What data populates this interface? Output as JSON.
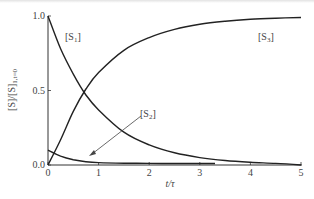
{
  "chart_data": {
    "type": "line",
    "title": "",
    "xlabel": "t/τ",
    "ylabel": "[S]/[S]1,t=0",
    "xlim": [
      0,
      5
    ],
    "ylim": [
      0,
      1.0
    ],
    "xticks": [
      "0",
      "1",
      "2",
      "3",
      "4",
      "5"
    ],
    "yticks": [
      "0.0",
      "0.5",
      "1.0"
    ],
    "grid": false,
    "legend": "inline labels",
    "series": [
      {
        "name": "[S1]",
        "x": [
          0,
          0.25,
          0.5,
          0.75,
          1,
          1.5,
          2,
          2.5,
          3,
          3.5,
          4,
          4.5,
          5
        ],
        "values": [
          1.0,
          0.78,
          0.61,
          0.47,
          0.37,
          0.22,
          0.135,
          0.082,
          0.05,
          0.03,
          0.018,
          0.011,
          0.0
        ]
      },
      {
        "name": "[S2]",
        "x": [
          0,
          0.25,
          0.5,
          0.75,
          1,
          1.5,
          2,
          2.5,
          3,
          3.3
        ],
        "values": [
          0.1,
          0.06,
          0.035,
          0.022,
          0.016,
          0.012,
          0.011,
          0.01,
          0.01,
          0.01
        ]
      },
      {
        "name": "[S3]",
        "x": [
          0,
          0.25,
          0.5,
          0.75,
          1,
          1.5,
          2,
          2.5,
          3,
          3.5,
          4,
          4.5,
          5
        ],
        "values": [
          0.0,
          0.17,
          0.36,
          0.51,
          0.62,
          0.77,
          0.855,
          0.91,
          0.945,
          0.965,
          0.978,
          0.985,
          0.99
        ]
      }
    ],
    "annotations": [
      {
        "text": "[S1]",
        "near": "top-left decaying curve"
      },
      {
        "text": "[S3]",
        "near": "upper-right rising curve"
      },
      {
        "text": "[S2]",
        "near": "arrow pointing to small curve near bottom"
      }
    ]
  },
  "labels": {
    "y_title_main": "[S]/[S]",
    "y_title_sub": "1,t=0",
    "x_title": "t/τ",
    "s1_main": "[S",
    "s1_sub": "1",
    "s2_main": "[S",
    "s2_sub": "2",
    "s3_main": "[S",
    "s3_sub": "3",
    "close_bracket": "]",
    "x_ticks": [
      "0",
      "1",
      "2",
      "3",
      "4",
      "5"
    ],
    "y_ticks": [
      "0.0",
      "0.5",
      "1.0"
    ]
  }
}
